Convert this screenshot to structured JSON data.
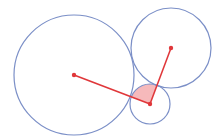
{
  "diagram": {
    "type": "tangent-circles",
    "colors": {
      "circle_stroke": "#7b8fc7",
      "segment": "#e0373a",
      "sector_fill": "#f6b9bb",
      "background": "#ffffff"
    },
    "circles": [
      {
        "name": "large-circle",
        "cx": 74,
        "cy": 75,
        "r": 60
      },
      {
        "name": "upper-right-circle",
        "cx": 171,
        "cy": 48,
        "r": 40
      },
      {
        "name": "small-circle",
        "cx": 150,
        "cy": 104,
        "r": 20
      }
    ],
    "segments": [
      {
        "name": "segment-small-to-large",
        "x1": 150,
        "y1": 104,
        "x2": 74,
        "y2": 75
      },
      {
        "name": "segment-small-to-upper-right",
        "x1": 150,
        "y1": 104,
        "x2": 171,
        "y2": 48
      }
    ],
    "points": [
      {
        "name": "large-center",
        "x": 74,
        "y": 75
      },
      {
        "name": "upper-right-center",
        "x": 171,
        "y": 48
      },
      {
        "name": "small-center",
        "x": 150,
        "y": 104
      }
    ],
    "sector": {
      "cx": 150,
      "cy": 104,
      "r": 20,
      "toward_a": [
        74,
        75
      ],
      "toward_b": [
        171,
        48
      ]
    }
  }
}
